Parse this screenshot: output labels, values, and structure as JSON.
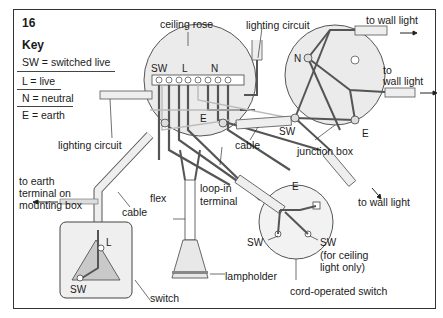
{
  "figure": {
    "number": "16",
    "key": {
      "title": "Key",
      "items": [
        {
          "abbr": "SW",
          "meaning": "SW = switched live"
        },
        {
          "abbr": "L",
          "meaning": "L = live"
        },
        {
          "abbr": "N",
          "meaning": "N = neutral"
        },
        {
          "abbr": "E",
          "meaning": "E = earth"
        }
      ]
    },
    "ceiling_rose": {
      "label": "ceiling rose",
      "terminals": {
        "sw": "SW",
        "l": "L",
        "n": "N",
        "e": "E"
      }
    },
    "junction_box": {
      "label": "junction box",
      "terminals": {
        "n": "N",
        "sw": "SW",
        "e": "E"
      }
    },
    "cord_switch": {
      "label": "cord-operated switch",
      "terminals": {
        "e": "E",
        "sw_left": "SW",
        "sw_right": "SW"
      },
      "note_line1": "(for ceiling",
      "note_line2": "light only)"
    },
    "wall_switch": {
      "label": "switch",
      "terminals": {
        "l": "L",
        "sw": "SW"
      }
    },
    "labels": {
      "lighting_circuit_top": "lighting circuit",
      "lighting_circuit_left": "lighting circuit",
      "to_wall_light_top": "to wall light",
      "to_wall_light_mid_1": "to",
      "to_wall_light_mid_2": "wall light",
      "to_wall_light_bottom": "to wall light",
      "cable_center": "cable",
      "cable_left": "cable",
      "flex": "flex",
      "loop_in_1": "loop-in",
      "loop_in_2": "terminal",
      "earth_1": "to earth",
      "earth_2": "terminal  on",
      "earth_3": "mounting box",
      "lampholder": "lampholder"
    },
    "colors": {
      "line": "#333333",
      "wire_dark": "#555555",
      "wire_light": "#bdbdbd",
      "box_fill": "#e6e6e6",
      "switch_fill": "#d9d9d9",
      "sheath": "#eeeeee"
    }
  }
}
